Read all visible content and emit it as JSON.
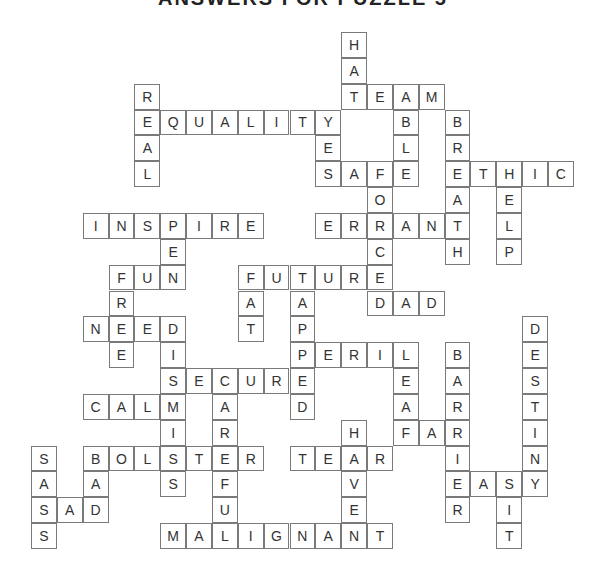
{
  "title": "ANSWERS FOR PUZZLE 5",
  "grid": {
    "cols": 21,
    "rows": [
      "............H........",
      "............A........",
      "....R.......TEAM.....",
      "....EQUALITY..B.B....",
      "....A......E..L.R....",
      "....L......SAFE.ETHIC",
      ".............O..A.E..",
      "..INSPIRE..ERRANT.L..",
      ".....E.......C..H.P..",
      "...FUN..FUTURE.......",
      "...R....A.A..DAD.....",
      "..NEED..T.P........D.",
      "...E.I....PERIL.B..E.",
      ".....SECURE...E.A..S.",
      "..CALM.A..D...A.R..T.",
      ".....I.R....H.FAR..I.",
      "S.BOLSTER.TEAR..I..N.",
      "A.A..S.F....V...EASY.",
      "SAD....U....E...R.I..",
      "S....MALIGNANT....T.."
    ]
  },
  "words": {
    "across": [
      "TEAM",
      "EQUALITY",
      "SAFE",
      "ETHIC",
      "INSPIRE",
      "ERRANT",
      "FUN",
      "FUTURE",
      "DAD",
      "NEED",
      "PERIL",
      "SECURE",
      "CALM",
      "FAR",
      "BOLSTER",
      "TEAR",
      "EASY",
      "SAD",
      "MALIGNANT"
    ],
    "down": [
      "HAT",
      "REAL",
      "YES",
      "ABLE",
      "BREATH",
      "FORCE",
      "HELP",
      "PEN",
      "FREE",
      "FAT",
      "TAPPED",
      "DISMISS",
      "LEAF",
      "BARRIER",
      "DESTINY",
      "CAREFUL",
      "HAVE",
      "BAD",
      "SASS",
      "SIT"
    ]
  }
}
